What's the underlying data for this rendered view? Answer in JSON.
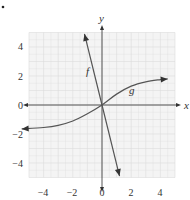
{
  "chart_data": {
    "type": "line",
    "title": "",
    "xlabel": "x",
    "ylabel": "y",
    "xlim": [
      -5,
      5
    ],
    "ylim": [
      -5,
      5
    ],
    "grid": true,
    "x_ticks": [
      -4,
      -2,
      0,
      2,
      4
    ],
    "y_ticks": [
      4,
      2,
      0,
      -2,
      -4
    ],
    "x_tick_labels": [
      "−4",
      "−2",
      "0",
      "2",
      "4"
    ],
    "y_tick_labels": [
      "4",
      "2",
      "0",
      "−2",
      "−4"
    ],
    "series": [
      {
        "name": "f",
        "description": "straight line through origin, steep negative slope, arrows at both ends",
        "x": [
          -1.2,
          0,
          1.2
        ],
        "y": [
          4.9,
          0,
          -4.9
        ]
      },
      {
        "name": "g",
        "description": "increasing odd curve through origin, leveling off toward about 2 on right and about -1.7 on left, arrows at both ends",
        "x": [
          -5.5,
          -4,
          -3,
          -2,
          -1,
          0,
          1,
          2,
          3,
          4,
          4.5
        ],
        "y": [
          -1.65,
          -1.55,
          -1.4,
          -1.1,
          -0.6,
          0,
          0.75,
          1.3,
          1.6,
          1.75,
          1.8
        ]
      }
    ],
    "annotations": [
      {
        "text": "f",
        "x": -1.0,
        "y": 2.5
      },
      {
        "text": "g",
        "x": 1.9,
        "y": 1.0
      }
    ]
  },
  "labels": {
    "x_axis": "x",
    "y_axis": "y",
    "f": "f",
    "g": "g",
    "xt": [
      "−4",
      "−2",
      "0",
      "2",
      "4"
    ],
    "yt": [
      "4",
      "2",
      "0",
      "−2",
      "−4"
    ]
  },
  "colors": {
    "grid": "#dcdcdc",
    "grid_bg": "#f4f4f4",
    "axis": "#444444",
    "curve": "#555555"
  }
}
